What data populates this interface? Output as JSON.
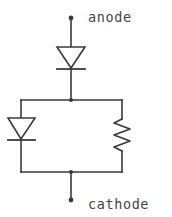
{
  "diagram": {
    "type": "electrical-schematic",
    "width": 172,
    "height": 217,
    "background_color": "#ffffff",
    "line_color": "#3a3a3a",
    "text_color": "#444444"
  },
  "labels": {
    "anode": "anode",
    "cathode": "cathode"
  },
  "terminals": [
    {
      "name": "anode-terminal",
      "label": "anode",
      "x": 71,
      "y": 18
    },
    {
      "name": "cathode-terminal",
      "label": "cathode",
      "x": 71,
      "y": 200
    }
  ],
  "components": [
    {
      "name": "series-diode",
      "kind": "diode",
      "orientation": "pointing-down",
      "apex_x": 71,
      "top_y": 47,
      "bar_y": 69
    },
    {
      "name": "branch-diode",
      "kind": "diode",
      "orientation": "pointing-down",
      "apex_x": 21,
      "top_y": 118,
      "bar_y": 140
    },
    {
      "name": "branch-resistor",
      "kind": "resistor",
      "orientation": "vertical-zigzag",
      "center_x": 122,
      "top_y": 118,
      "bottom_y": 152
    }
  ],
  "nets": {
    "top_bus_y": 100,
    "bottom_bus_y": 172,
    "bus_left_x": 21,
    "bus_right_x": 122,
    "trunk_x": 71
  }
}
